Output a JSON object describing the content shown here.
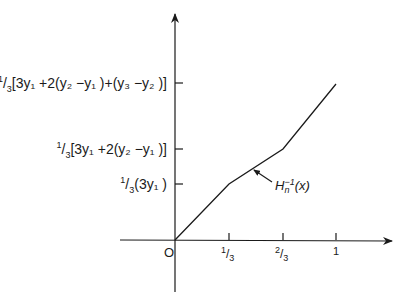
{
  "diagram": {
    "curve_label": {
      "base": "H",
      "subscript": "n",
      "superscript": "−1",
      "argument": "(x)"
    },
    "origin_label": "O",
    "x_axis": {
      "ticks": [
        {
          "num": "1",
          "den": "3",
          "value": 0.3333
        },
        {
          "num": "2",
          "den": "3",
          "value": 0.6667
        },
        {
          "num": "1",
          "den": "",
          "value": 1
        }
      ]
    },
    "y_axis": {
      "ticks": [
        {
          "prefix_num": "1",
          "prefix_den": "3",
          "expr": "(3y₁ )"
        },
        {
          "prefix_num": "1",
          "prefix_den": "3",
          "expr": "[3y₁ +2(y₂ −y₁ )]"
        },
        {
          "prefix_num": "1",
          "prefix_den": "3",
          "expr": "[3y₁ +2(y₂ −y₁ )+(y₃ −y₂ )]"
        }
      ]
    },
    "curve_points": [
      {
        "x": 0,
        "y": "0"
      },
      {
        "x": "1/3",
        "y": "1/3(3y₁)"
      },
      {
        "x": "2/3",
        "y": "1/3[3y₁+2(y₂−y₁)]"
      },
      {
        "x": "1",
        "y": "1/3[3y₁+2(y₂−y₁)+(y₃−y₂)]"
      }
    ],
    "colors": {
      "ink": "#1a1a1a",
      "background": "#ffffff"
    }
  }
}
